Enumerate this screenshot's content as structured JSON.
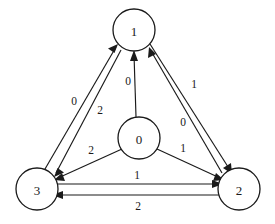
{
  "diagram": {
    "background_color": "#ffffff",
    "stroke_color": "#1a1a1a",
    "nodes": [
      {
        "id": "n0",
        "label": "0",
        "cx": 139,
        "cy": 138,
        "r": 21
      },
      {
        "id": "n1",
        "label": "1",
        "cx": 134,
        "cy": 30,
        "r": 21
      },
      {
        "id": "n2",
        "label": "2",
        "cx": 239,
        "cy": 189,
        "r": 21
      },
      {
        "id": "n3",
        "label": "3",
        "cx": 37,
        "cy": 189,
        "r": 21
      }
    ],
    "edges": [
      {
        "id": "e_3_1",
        "from": "3",
        "to": "1",
        "label": "0",
        "label_x": 74,
        "label_y": 101
      },
      {
        "id": "e_1_3",
        "from": "1",
        "to": "3",
        "label": "2",
        "label_x": 100,
        "label_y": 110
      },
      {
        "id": "e_0_1",
        "from": "0",
        "to": "1",
        "label": "0",
        "label_x": 128,
        "label_y": 81
      },
      {
        "id": "e_1_2",
        "from": "1",
        "to": "2",
        "label": "1",
        "label_x": 194,
        "label_y": 84
      },
      {
        "id": "e_2_1",
        "from": "2",
        "to": "1",
        "label": "0",
        "label_x": 183,
        "label_y": 122
      },
      {
        "id": "e_0_3",
        "from": "0",
        "to": "3",
        "label": "2",
        "label_x": 91,
        "label_y": 150
      },
      {
        "id": "e_0_2",
        "from": "0",
        "to": "2",
        "label": "1",
        "label_x": 183,
        "label_y": 148
      },
      {
        "id": "e_3_2",
        "from": "3",
        "to": "2",
        "label": "1",
        "label_x": 137,
        "label_y": 175
      },
      {
        "id": "e_2_3",
        "from": "2",
        "to": "3",
        "label": "2",
        "label_x": 138,
        "label_y": 206
      }
    ]
  }
}
